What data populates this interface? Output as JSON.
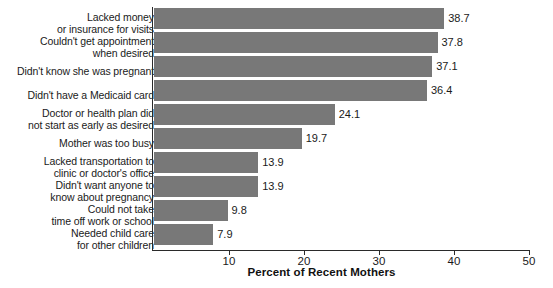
{
  "chart_data": {
    "type": "bar",
    "orientation": "horizontal",
    "title": "",
    "xlabel": "Percent of Recent Mothers",
    "ylabel": "",
    "xlim": [
      0,
      50
    ],
    "xticks": [
      10,
      20,
      30,
      40,
      50
    ],
    "xtick_labels": [
      "10",
      "20",
      "30",
      "40",
      "50"
    ],
    "grid": false,
    "legend": null,
    "bar_color": "#787878",
    "axis_color": "#2a2a2a",
    "categories": [
      "Lacked money\nor insurance for visits",
      "Couldn't get appointment\nwhen desired",
      "Didn't know she was pregnant",
      "Didn't have a Medicaid card",
      "Doctor or health plan did\nnot start as early as desired",
      "Mother was too busy",
      "Lacked transportation to\nclinic or doctor's office",
      "Didn't want anyone to\nknow about pregnancy",
      "Could not take\ntime off work or school",
      "Needed child care\nfor other children"
    ],
    "values": [
      38.7,
      37.8,
      37.1,
      36.4,
      24.1,
      19.7,
      13.9,
      13.9,
      9.8,
      7.9
    ],
    "value_labels": [
      "38.7",
      "37.8",
      "37.1",
      "36.4",
      "24.1",
      "19.7",
      "13.9",
      "13.9",
      "9.8",
      "7.9"
    ]
  }
}
